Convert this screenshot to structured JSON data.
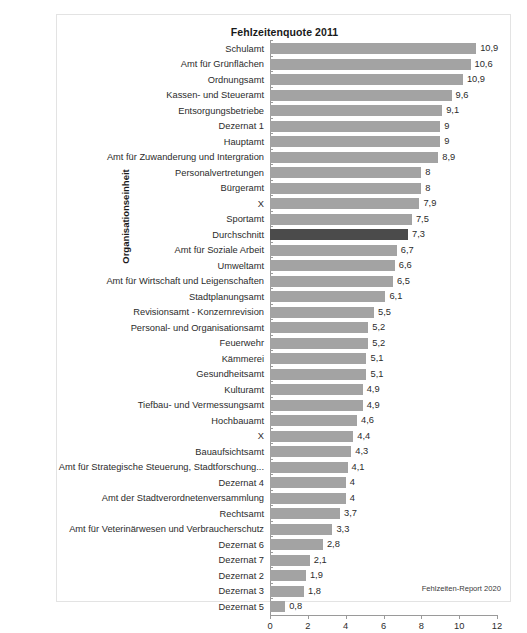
{
  "figure": {
    "title": "Fehlzeitenquote 2011",
    "yaxis_title": "Organisationseinheit",
    "source_note": "Fehlzeiten-Report 2020",
    "bar_color": "#a3a3a3",
    "highlight_color": "#4b4b4b",
    "axis_color": "#9a9a9a",
    "text_color": "#2b2b2b",
    "frame_color": "#e3e3e3",
    "background": "#ffffff"
  },
  "chart_data": {
    "type": "bar",
    "orientation": "horizontal",
    "title": "Fehlzeitenquote 2011",
    "xlabel": "",
    "ylabel": "Organisationseinheit",
    "xlim": [
      0,
      12
    ],
    "xticks": [
      0,
      2,
      4,
      6,
      8,
      10,
      12
    ],
    "xtick_labels": [
      "0",
      "2",
      "4",
      "6",
      "8",
      "10",
      "12"
    ],
    "grid": false,
    "legend": false,
    "decimal_separator": ",",
    "highlight_category": "Durchschnitt",
    "source": "Fehlzeiten-Report 2020",
    "categories": [
      "Schulamt",
      "Amt für Grünflächen",
      "Ordnungsamt",
      "Kassen- und Steueramt",
      "Entsorgungsbetriebe",
      "Dezernat 1",
      "Hauptamt",
      "Amt für Zuwanderung und Intergration",
      "Personalvertretungen",
      "Bürgeramt",
      "X",
      "Sportamt",
      "Durchschnitt",
      "Amt für Soziale Arbeit",
      "Umweltamt",
      "Amt für Wirtschaft und Leigenschaften",
      "Stadtplanungsamt",
      "Revisionsamt - Konzernrevision",
      "Personal- und Organisationsamt",
      "Feuerwehr",
      "Kämmerei",
      "Gesundheitsamt",
      "Kulturamt",
      "Tiefbau- und Vermessungsamt",
      "Hochbauamt",
      "X",
      "Bauaufsichtsamt",
      "Amt für Strategische Steuerung, Stadtforschung...",
      "Dezernat 4",
      "Amt der Stadtverordnetenversammlung",
      "Rechtsamt",
      "Amt für Veterinärwesen und Verbraucherschutz",
      "Dezernat 6",
      "Dezernat 7",
      "Dezernat 2",
      "Dezernat 3",
      "Dezernat 5"
    ],
    "values": [
      10.9,
      10.6,
      10.2,
      9.6,
      9.1,
      9.0,
      9.0,
      8.9,
      8.0,
      8.0,
      7.9,
      7.5,
      7.3,
      6.7,
      6.6,
      6.5,
      6.1,
      5.5,
      5.2,
      5.2,
      5.1,
      5.1,
      4.9,
      4.9,
      4.6,
      4.4,
      4.3,
      4.1,
      4.0,
      4.0,
      3.7,
      3.3,
      2.8,
      2.1,
      1.9,
      1.8,
      0.8
    ],
    "value_labels": [
      "10,9",
      "10,6",
      "10,9",
      "9,6",
      "9,1",
      "9",
      "9",
      "8,9",
      "8",
      "8",
      "7,9",
      "7,5",
      "7,3",
      "6,7",
      "6,6",
      "6,5",
      "6,1",
      "5,5",
      "5,2",
      "5,2",
      "5,1",
      "5,1",
      "4,9",
      "4,9",
      "4,6",
      "4,4",
      "4,3",
      "4,1",
      "4",
      "4",
      "3,7",
      "3,3",
      "2,8",
      "2,1",
      "1,9",
      "1,8",
      "0,8"
    ]
  }
}
